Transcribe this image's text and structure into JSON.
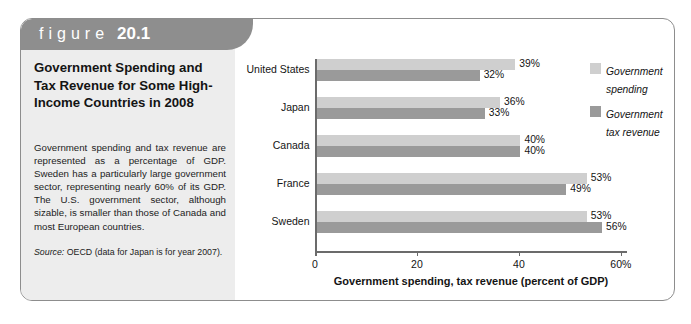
{
  "figure": {
    "banner_word": "figure",
    "banner_number": "20.1",
    "title": "Government Spending and Tax Revenue for Some High-Income Countries in 2008",
    "caption": "Government spending and tax revenue are represented as a percentage of GDP. Sweden has a particularly large government sector, representing nearly 60% of its GDP. The U.S. government sector, although sizable, is smaller than those of Canada and most European countries.",
    "source_label": "Source:",
    "source_text": "OECD (data for Japan is for year 2007)."
  },
  "colors": {
    "banner": "#8e8e8e",
    "panel": "#ededed",
    "spending_bar": "#cfcfcf",
    "revenue_bar": "#9a9a9a",
    "axis": "#6b6b6b",
    "border": "#8d8d8d"
  },
  "chart_data": {
    "type": "bar",
    "orientation": "horizontal",
    "title": "Government Spending and Tax Revenue for Some High-Income Countries in 2008",
    "subtitle": "",
    "xlabel": "Government spending, tax revenue (percent of GDP)",
    "ylabel": "",
    "categories": [
      "United States",
      "Japan",
      "Canada",
      "France",
      "Sweden"
    ],
    "series": [
      {
        "name": "Government spending",
        "values": [
          39,
          36,
          40,
          53,
          53
        ],
        "labels": [
          "39%",
          "36%",
          "40%",
          "53%",
          "53%"
        ],
        "color": "#cfcfcf"
      },
      {
        "name": "Government tax revenue",
        "values": [
          32,
          33,
          40,
          49,
          56
        ],
        "labels": [
          "32%",
          "33%",
          "40%",
          "49%",
          "56%"
        ],
        "color": "#9a9a9a"
      }
    ],
    "xlim": [
      0,
      61.2
    ],
    "xticks": [
      0,
      20,
      40,
      60
    ],
    "xtick_labels": [
      "0",
      "20",
      "40",
      "60%"
    ],
    "grid": false,
    "legend_position": "right",
    "legend": [
      "Government spending",
      "Government tax revenue"
    ]
  }
}
